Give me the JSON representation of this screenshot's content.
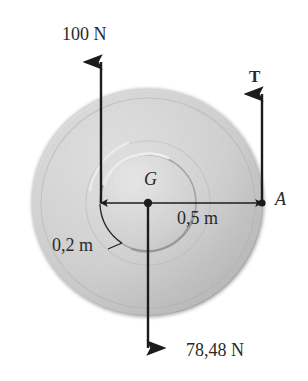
{
  "figure": {
    "body": {
      "shape": "disk",
      "center_label": "G",
      "edge_point_label": "A",
      "outer_radius_label": "0,5 m",
      "inner_radius_label": "0,2 m",
      "fill_light": "#e3e3e3",
      "fill_dark": "#a9a9a9",
      "edge_color": "#8c8c8c"
    },
    "forces": [
      {
        "id": "applied-force",
        "label": "100 N",
        "direction": "up",
        "style": "plain",
        "magnitude": 100,
        "unit": "N",
        "applied_at": "left edge of inner hub, 0,2 m left of G"
      },
      {
        "id": "tension-force",
        "label": "T",
        "direction": "up",
        "style": "bold",
        "unit": "",
        "applied_at": "point A, 0,5 m right of G"
      },
      {
        "id": "weight-force",
        "label": "78,48 N",
        "direction": "down",
        "style": "plain",
        "magnitude": 78.48,
        "unit": "N",
        "applied_at": "center of gravity G"
      }
    ],
    "dimensions": [
      {
        "id": "outer-radius",
        "label": "0,5 m",
        "value": 0.5,
        "unit": "m",
        "from": "G",
        "to": "A"
      },
      {
        "id": "inner-radius",
        "label": "0,2 m",
        "value": 0.2,
        "unit": "m",
        "from": "G",
        "to": "hub edge"
      }
    ],
    "points": [
      {
        "id": "point-g",
        "label": "G",
        "description": "center of gravity"
      },
      {
        "id": "point-a",
        "label": "A",
        "description": "point of tension application on rim"
      }
    ],
    "line_color": "#1c1c1c"
  }
}
